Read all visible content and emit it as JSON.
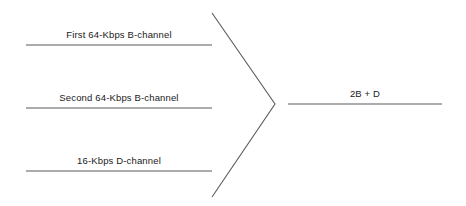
{
  "diagram": {
    "type": "convergence-diagram",
    "background_color": "#ffffff",
    "line_color": "#5a5a5a",
    "text_color": "#1a1a1a",
    "inputs": [
      {
        "id": "b-channel-1",
        "label": "First 64-Kbps B-channel",
        "line": {
          "x1": 26,
          "y1": 45,
          "x2": 212,
          "y2": 45
        },
        "label_position": {
          "x": 119,
          "y": 29
        }
      },
      {
        "id": "b-channel-2",
        "label": "Second 64-Kbps B-channel",
        "line": {
          "x1": 26,
          "y1": 108,
          "x2": 212,
          "y2": 108
        },
        "label_position": {
          "x": 119,
          "y": 92
        }
      },
      {
        "id": "d-channel",
        "label": "16-Kbps D-channel",
        "line": {
          "x1": 26,
          "y1": 171,
          "x2": 212,
          "y2": 171
        },
        "label_position": {
          "x": 119,
          "y": 155
        }
      }
    ],
    "connector": {
      "id": "v-connector",
      "top_point": {
        "x": 212,
        "y": 13
      },
      "apex_point": {
        "x": 275,
        "y": 104
      },
      "bottom_point": {
        "x": 212,
        "y": 197
      }
    },
    "output": {
      "id": "aggregate-output",
      "label": "2B + D",
      "line": {
        "x1": 288,
        "y1": 104,
        "x2": 442,
        "y2": 104
      },
      "label_position": {
        "x": 365,
        "y": 88
      }
    }
  }
}
